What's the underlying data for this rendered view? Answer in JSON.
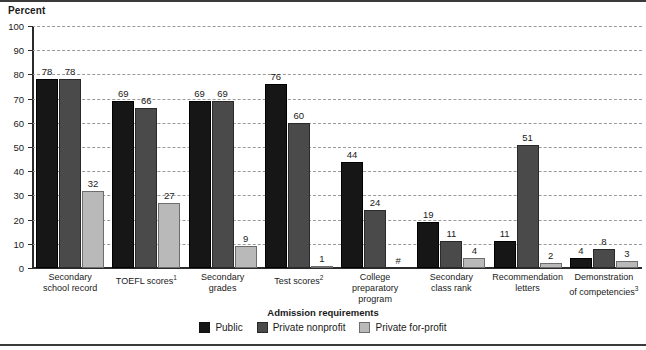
{
  "figure": {
    "y_axis_title": "Percent",
    "x_axis_title": "Admission requirements"
  },
  "legend": {
    "items": [
      {
        "label": "Public",
        "color": "#161616"
      },
      {
        "label": "Private nonprofit",
        "color": "#4a4a4a"
      },
      {
        "label": "Private for-profit",
        "color": "#b9b9b9"
      }
    ]
  },
  "chart_data": {
    "type": "bar",
    "title": "",
    "xlabel": "Admission requirements",
    "ylabel": "Percent",
    "ylim": [
      0,
      100
    ],
    "yticks": [
      0,
      10,
      20,
      30,
      40,
      50,
      60,
      70,
      80,
      90,
      100
    ],
    "grid": true,
    "legend_position": "bottom",
    "categories": [
      "Secondary school record",
      "TOEFL scores¹",
      "Secondary grades",
      "Test scores²",
      "College preparatory program",
      "Secondary class rank",
      "Recommendation letters",
      "Demonstration of competencies³"
    ],
    "category_lines": [
      [
        "Secondary",
        "school record"
      ],
      [
        "TOEFL scores¹"
      ],
      [
        "Secondary",
        "grades"
      ],
      [
        "Test scores²"
      ],
      [
        "College",
        "preparatory",
        "program"
      ],
      [
        "Secondary",
        "class rank"
      ],
      [
        "Recommendation",
        "letters"
      ],
      [
        "Demonstration",
        "of competencies³"
      ]
    ],
    "series": [
      {
        "name": "Public",
        "values": [
          78,
          69,
          69,
          76,
          44,
          19,
          11,
          4
        ],
        "labels": [
          "78",
          "69",
          "69",
          "76",
          "44",
          "19",
          "11",
          "4"
        ]
      },
      {
        "name": "Private nonprofit",
        "values": [
          78,
          66,
          69,
          60,
          24,
          11,
          51,
          8
        ],
        "labels": [
          "78",
          "66",
          "69",
          "60",
          "24",
          "11",
          "51",
          "8"
        ]
      },
      {
        "name": "Private for-profit",
        "values": [
          32,
          27,
          9,
          1,
          0,
          4,
          2,
          3
        ],
        "labels": [
          "32",
          "27",
          "9",
          "1",
          "#",
          "4",
          "2",
          "3"
        ]
      }
    ]
  },
  "ytick_labels": [
    "100",
    "90",
    "80",
    "70",
    "60",
    "50",
    "40",
    "30",
    "20",
    "10",
    "0"
  ]
}
